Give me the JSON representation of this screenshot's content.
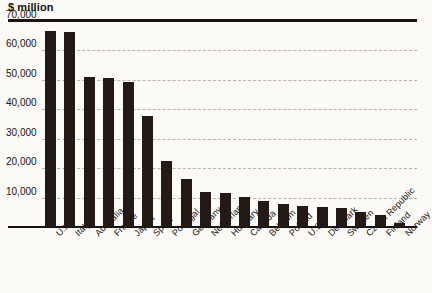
{
  "chart_data": {
    "type": "bar",
    "title": "$ million",
    "xlabel": "",
    "ylabel": "$ million",
    "ylim": [
      0,
      70000
    ],
    "yticks": [
      10000,
      20000,
      30000,
      40000,
      50000,
      60000,
      70000
    ],
    "ytick_labels": [
      "10,000",
      "20,000",
      "30,000",
      "40,000",
      "50,000",
      "60,000",
      "70,000"
    ],
    "grid": true,
    "legend": "none",
    "bar_color": "#231a16",
    "categories": [
      "U.K.",
      "Italy",
      "Australia",
      "France",
      "Japan",
      "Spain",
      "Portugal",
      "Germany",
      "Netherlands",
      "Hungary",
      "Canada",
      "Belgium",
      "Poland",
      "U.S.",
      "Denmark",
      "Sweden",
      "Czech Republic",
      "Finland",
      "Norway"
    ],
    "values": [
      66500,
      66300,
      51000,
      50500,
      49400,
      37800,
      22500,
      16300,
      12000,
      11500,
      10200,
      9000,
      7900,
      7200,
      6700,
      6400,
      5200,
      4000,
      1500
    ]
  }
}
